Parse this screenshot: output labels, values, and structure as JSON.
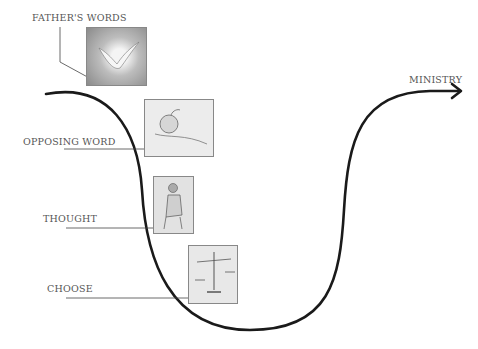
{
  "diagram": {
    "labels": {
      "fathers_words": "FATHER'S WORDS",
      "opposing_word": "OPPOSING WORD",
      "thought": "THOUGHT",
      "choose": "CHOOSE",
      "ministry": "MINISTRY"
    },
    "images": [
      {
        "name": "dove-illustration",
        "depicts": "dove"
      },
      {
        "name": "apple-in-hand-illustration",
        "depicts": "apple in hand"
      },
      {
        "name": "thinking-man-illustration",
        "depicts": "seated thinking man"
      },
      {
        "name": "scales-illustration",
        "depicts": "balance scales"
      }
    ],
    "colors": {
      "curve": "#1a1a1a",
      "text": "#555555",
      "leader": "#444444"
    }
  }
}
